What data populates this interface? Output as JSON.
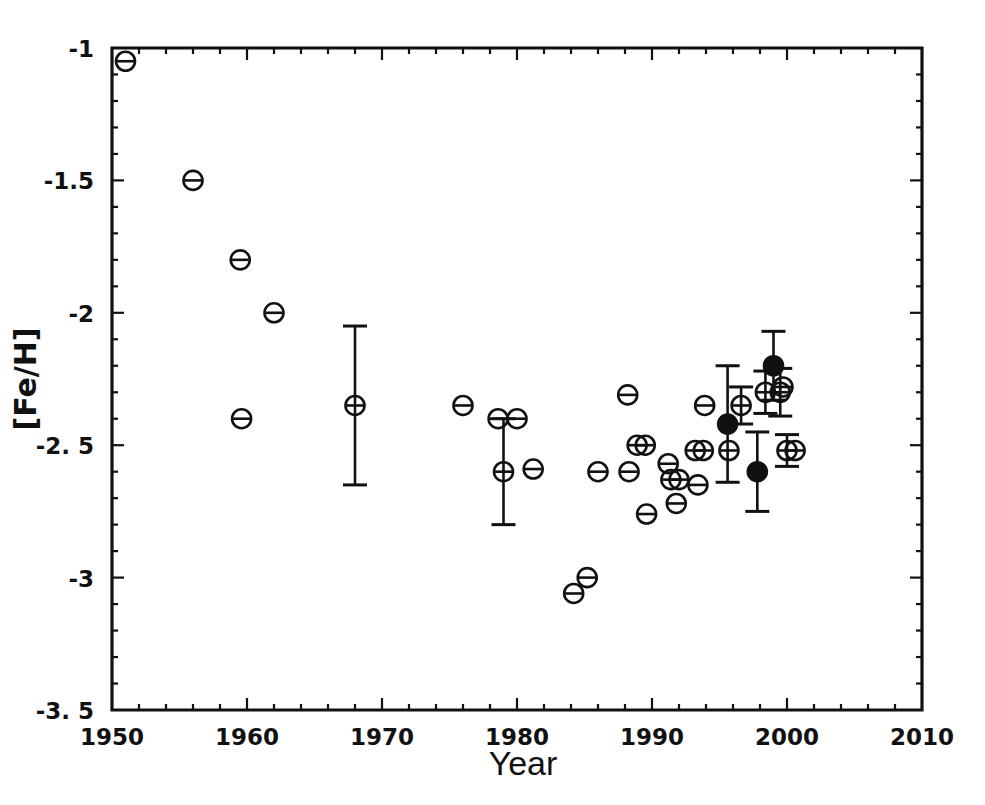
{
  "chart_data": {
    "type": "scatter",
    "title": "",
    "xlabel": "Year",
    "ylabel": "[Fe/H]",
    "xlim": [
      1950,
      2010
    ],
    "ylim": [
      -3.5,
      -1.0
    ],
    "grid": false,
    "legend": "none",
    "xticks": [
      1950,
      1960,
      1970,
      1980,
      1990,
      2000,
      2010
    ],
    "xticklabels": [
      "1950",
      "1960",
      "1970",
      "1980",
      "1990",
      "2000",
      "2010"
    ],
    "yticks": [
      -1.0,
      -1.5,
      -2.0,
      -2.5,
      -3.0,
      -3.5
    ],
    "yticklabels": [
      "-1",
      "-1.5",
      "-2",
      "-2. 5",
      "-3",
      "-3. 5"
    ],
    "series": [
      {
        "name": "measurements",
        "marker": "circle-with-horizontal-bar",
        "points": [
          {
            "x": 1951.0,
            "y": -1.05,
            "filled": false,
            "err": null
          },
          {
            "x": 1956.0,
            "y": -1.5,
            "filled": false,
            "err": null
          },
          {
            "x": 1959.5,
            "y": -1.8,
            "filled": false,
            "err": null
          },
          {
            "x": 1959.6,
            "y": -2.4,
            "filled": false,
            "err": null
          },
          {
            "x": 1962.0,
            "y": -2.0,
            "filled": false,
            "err": null
          },
          {
            "x": 1968.0,
            "y": -2.35,
            "filled": false,
            "err": 0.3
          },
          {
            "x": 1976.0,
            "y": -2.35,
            "filled": false,
            "err": null
          },
          {
            "x": 1978.6,
            "y": -2.4,
            "filled": false,
            "err": null
          },
          {
            "x": 1979.0,
            "y": -2.6,
            "filled": false,
            "err": 0.2
          },
          {
            "x": 1980.0,
            "y": -2.4,
            "filled": false,
            "err": null
          },
          {
            "x": 1981.2,
            "y": -2.59,
            "filled": false,
            "err": null
          },
          {
            "x": 1984.2,
            "y": -3.06,
            "filled": false,
            "err": null
          },
          {
            "x": 1985.2,
            "y": -3.0,
            "filled": false,
            "err": null
          },
          {
            "x": 1986.0,
            "y": -2.6,
            "filled": false,
            "err": null
          },
          {
            "x": 1988.2,
            "y": -2.31,
            "filled": false,
            "err": null
          },
          {
            "x": 1988.3,
            "y": -2.6,
            "filled": false,
            "err": null
          },
          {
            "x": 1988.9,
            "y": -2.5,
            "filled": false,
            "err": null
          },
          {
            "x": 1989.5,
            "y": -2.5,
            "filled": false,
            "err": null
          },
          {
            "x": 1989.6,
            "y": -2.76,
            "filled": false,
            "err": null
          },
          {
            "x": 1991.2,
            "y": -2.57,
            "filled": false,
            "err": null
          },
          {
            "x": 1991.4,
            "y": -2.63,
            "filled": false,
            "err": null
          },
          {
            "x": 1992.0,
            "y": -2.63,
            "filled": false,
            "err": null
          },
          {
            "x": 1991.8,
            "y": -2.72,
            "filled": false,
            "err": null
          },
          {
            "x": 1993.2,
            "y": -2.52,
            "filled": false,
            "err": null
          },
          {
            "x": 1993.8,
            "y": -2.52,
            "filled": false,
            "err": null
          },
          {
            "x": 1993.9,
            "y": -2.35,
            "filled": false,
            "err": null
          },
          {
            "x": 1993.4,
            "y": -2.65,
            "filled": false,
            "err": null
          },
          {
            "x": 1995.6,
            "y": -2.42,
            "filled": true,
            "err": 0.22
          },
          {
            "x": 1995.7,
            "y": -2.52,
            "filled": false,
            "err": null
          },
          {
            "x": 1996.6,
            "y": -2.35,
            "filled": false,
            "err": 0.07
          },
          {
            "x": 1997.8,
            "y": -2.6,
            "filled": true,
            "err": 0.15
          },
          {
            "x": 1998.4,
            "y": -2.3,
            "filled": false,
            "err": 0.08
          },
          {
            "x": 1999.0,
            "y": -2.2,
            "filled": true,
            "err": 0.13
          },
          {
            "x": 1999.5,
            "y": -2.3,
            "filled": false,
            "err": 0.09
          },
          {
            "x": 1999.7,
            "y": -2.28,
            "filled": false,
            "err": null
          },
          {
            "x": 2000.0,
            "y": -2.52,
            "filled": false,
            "err": 0.06
          },
          {
            "x": 2000.6,
            "y": -2.52,
            "filled": false,
            "err": null
          }
        ]
      }
    ]
  },
  "figure": {
    "axis_color": "#111111",
    "background": "#ffffff",
    "marker_color": "#111111"
  }
}
